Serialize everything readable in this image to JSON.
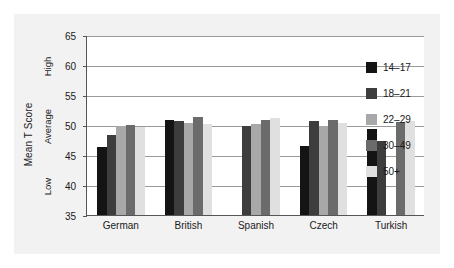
{
  "chart_data": {
    "type": "bar",
    "title": "",
    "subtitle": "",
    "xlabel": "",
    "ylabel": "Mean T Score",
    "ylim": [
      35,
      65
    ],
    "yticks": [
      35,
      40,
      45,
      50,
      55,
      60,
      65
    ],
    "grid": true,
    "legend_position": "right",
    "qualitative_bands": [
      {
        "label": "High",
        "value": 60
      },
      {
        "label": "Average",
        "value": 50
      },
      {
        "label": "Low",
        "value": 40
      }
    ],
    "categories": [
      "German",
      "British",
      "Spanish",
      "Czech",
      "Turkish"
    ],
    "series": [
      {
        "name": "14–17",
        "color": "#141414",
        "values": [
          46.3,
          50.9,
          null,
          46.5,
          49.3
        ]
      },
      {
        "name": "18–21",
        "color": "#3d3d3d",
        "values": [
          48.3,
          50.7,
          49.9,
          50.7,
          47.3
        ]
      },
      {
        "name": "22–29",
        "color": "#a8a8a8",
        "values": [
          49.8,
          50.3,
          50.1,
          49.8,
          null
        ]
      },
      {
        "name": "30–49",
        "color": "#6b6b6b",
        "values": [
          50.0,
          51.3,
          50.9,
          50.9,
          50.5
        ]
      },
      {
        "name": "50+",
        "color": "#e0e0e0",
        "values": [
          49.6,
          50.1,
          51.2,
          50.4,
          50.6
        ]
      }
    ]
  },
  "legend": {
    "items": [
      {
        "label": "14–17",
        "color": "#141414"
      },
      {
        "label": "18–21",
        "color": "#3d3d3d"
      },
      {
        "label": "22–29",
        "color": "#a8a8a8"
      },
      {
        "label": "30–49",
        "color": "#6b6b6b"
      },
      {
        "label": "50+",
        "color": "#e0e0e0"
      }
    ]
  }
}
